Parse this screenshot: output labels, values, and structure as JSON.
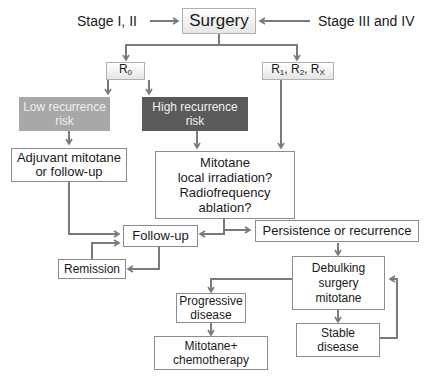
{
  "title": "Surgery",
  "inputs": {
    "left": "Stage I, II",
    "right": "Stage III and IV"
  },
  "resection": {
    "r0": {
      "base": "R",
      "sub": "0"
    },
    "r12x": {
      "parts": [
        {
          "base": "R",
          "sub": "1"
        },
        {
          "base": "R",
          "sub": "2"
        },
        {
          "base": "R",
          "sub": "X"
        }
      ]
    }
  },
  "risk": {
    "low": {
      "line1": "Low recurrence",
      "line2": "risk",
      "color": "#a8a8a8"
    },
    "high": {
      "line1": "High recurrence",
      "line2": "risk",
      "color": "#5a5a5a"
    }
  },
  "nodes": {
    "adjuvant": {
      "line1": "Adjuvant mitotane",
      "line2": "or follow-up"
    },
    "mitotane": {
      "line1": "Mitotane",
      "line2": "local irradiation?",
      "line3": "Radiofrequency",
      "line4": "ablation?"
    },
    "followup": "Follow-up",
    "persistence": "Persistence or recurrence",
    "remission": "Remission",
    "debulking": {
      "line1": "Debulking",
      "line2": "surgery",
      "line3": "mitotane"
    },
    "progressive": {
      "line1": "Progressive",
      "line2": "disease"
    },
    "stable": {
      "line1": "Stable",
      "line2": "disease"
    },
    "chemo": {
      "line1": "Mitotane+",
      "line2": "chemotherapy"
    }
  },
  "colors": {
    "line": "#7a7a7a",
    "border": "#8c8c8c"
  }
}
